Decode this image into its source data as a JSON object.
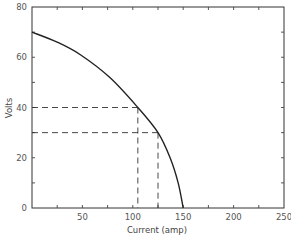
{
  "chart_data": {
    "type": "line",
    "title": "",
    "xlabel": "Current (amp)",
    "ylabel": "Volts",
    "xlim": [
      0,
      250
    ],
    "ylim": [
      0,
      80
    ],
    "x_ticks_major": [
      50,
      100,
      150,
      200,
      250
    ],
    "x_tick_labels": [
      "50",
      "100",
      "150",
      "200",
      "250"
    ],
    "x_ticks_minor_step": 25,
    "y_ticks_major": [
      0,
      20,
      40,
      60,
      80
    ],
    "y_tick_labels": [
      "0",
      "20",
      "40",
      "60",
      "80"
    ],
    "y_ticks_minor_step": 10,
    "grid": false,
    "series": [
      {
        "name": "V-I characteristic",
        "x": [
          0,
          25,
          48,
          77,
          105,
          125,
          137,
          145,
          150
        ],
        "y": [
          70,
          66,
          61,
          52,
          40,
          30,
          20,
          10,
          0
        ]
      }
    ],
    "guides": [
      {
        "volts": 40,
        "current": 105
      },
      {
        "volts": 30,
        "current": 125
      }
    ]
  }
}
